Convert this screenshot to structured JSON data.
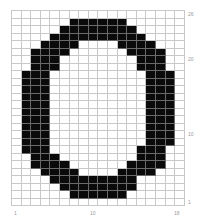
{
  "figure": {
    "columns": 18,
    "rows": 26,
    "cell_width": 9.6,
    "cell_height": 7.5,
    "fill_color": "#0a0a0a",
    "grid_color": "#c8c8c8",
    "filled_runs": [
      [],
      [
        [
          7,
          12
        ]
      ],
      [
        [
          6,
          13
        ]
      ],
      [
        [
          5,
          14
        ]
      ],
      [
        [
          4,
          7
        ],
        [
          12,
          15
        ]
      ],
      [
        [
          3,
          6
        ],
        [
          13,
          16
        ]
      ],
      [
        [
          3,
          5
        ],
        [
          14,
          16
        ]
      ],
      [
        [
          3,
          5
        ],
        [
          14,
          16
        ]
      ],
      [
        [
          2,
          4
        ],
        [
          15,
          17
        ]
      ],
      [
        [
          2,
          4
        ],
        [
          15,
          17
        ]
      ],
      [
        [
          2,
          4
        ],
        [
          15,
          17
        ]
      ],
      [
        [
          2,
          4
        ],
        [
          15,
          17
        ]
      ],
      [
        [
          2,
          4
        ],
        [
          15,
          17
        ]
      ],
      [
        [
          2,
          4
        ],
        [
          15,
          17
        ]
      ],
      [
        [
          2,
          4
        ],
        [
          15,
          17
        ]
      ],
      [
        [
          2,
          4
        ],
        [
          15,
          17
        ]
      ],
      [
        [
          2,
          4
        ],
        [
          15,
          17
        ]
      ],
      [
        [
          2,
          4
        ],
        [
          15,
          17
        ]
      ],
      [
        [
          2,
          4
        ],
        [
          14,
          16
        ]
      ],
      [
        [
          3,
          5
        ],
        [
          14,
          16
        ]
      ],
      [
        [
          3,
          6
        ],
        [
          13,
          16
        ]
      ],
      [
        [
          4,
          7
        ],
        [
          12,
          15
        ]
      ],
      [
        [
          5,
          13
        ]
      ],
      [
        [
          6,
          13
        ]
      ],
      [
        [
          7,
          12
        ]
      ],
      []
    ]
  },
  "axis_labels": {
    "right": [
      {
        "text": "26",
        "row": 1
      },
      {
        "text": "20",
        "row": 7
      },
      {
        "text": "10",
        "row": 17
      },
      {
        "text": "1",
        "row": 26
      }
    ],
    "bottom": [
      {
        "text": "1",
        "col": 1
      },
      {
        "text": "10",
        "col": 10
      },
      {
        "text": "18",
        "col": 18
      }
    ]
  }
}
